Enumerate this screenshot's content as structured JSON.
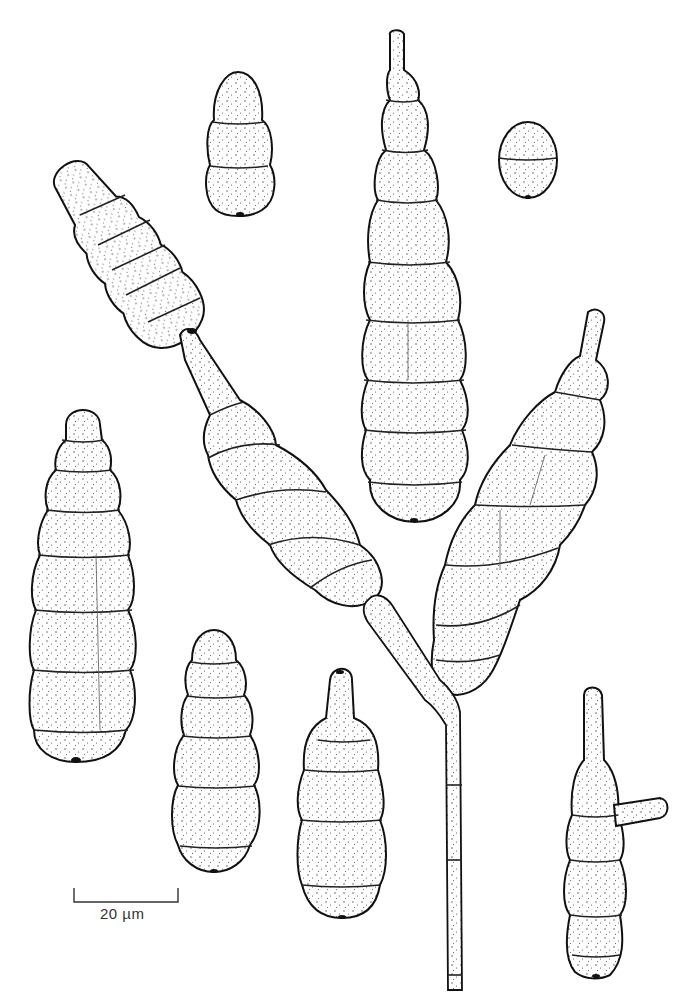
{
  "figure": {
    "type": "botanical line-and-stipple illustration",
    "scale_bar": {
      "label": "20 µm",
      "length_px": 104
    }
  },
  "colors": {
    "ink": "#111111",
    "background": "#ffffff"
  }
}
